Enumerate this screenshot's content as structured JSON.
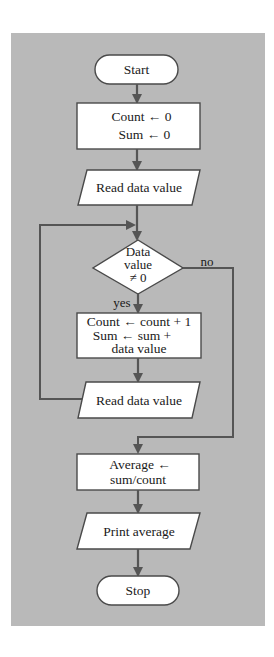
{
  "diagram": {
    "type": "flowchart",
    "colors": {
      "background": "#ffffff",
      "panel": "#b9b9b9",
      "shape_fill": "#ffffff",
      "stroke": "#4a4a4a",
      "arrow": "#555555",
      "text": "#1a1a1a"
    },
    "nodes": [
      {
        "id": "start",
        "shape": "terminal",
        "lines": [
          "Start"
        ]
      },
      {
        "id": "init",
        "shape": "process",
        "lines": [
          "Count ← 0",
          "Sum ← 0"
        ]
      },
      {
        "id": "read1",
        "shape": "input-output",
        "lines": [
          "Read data value"
        ]
      },
      {
        "id": "decision",
        "shape": "decision",
        "lines": [
          "Data",
          "value",
          "≠ 0"
        ]
      },
      {
        "id": "accumulate",
        "shape": "process",
        "lines": [
          "Count ← count + 1",
          "Sum ← sum +",
          "data value"
        ]
      },
      {
        "id": "read2",
        "shape": "input-output",
        "lines": [
          "Read data value"
        ]
      },
      {
        "id": "average",
        "shape": "process",
        "lines": [
          "Average ←",
          "sum/count"
        ]
      },
      {
        "id": "print",
        "shape": "input-output",
        "lines": [
          "Print average"
        ]
      },
      {
        "id": "stop",
        "shape": "terminal",
        "lines": [
          "Stop"
        ]
      }
    ],
    "edges": [
      {
        "from": "start",
        "to": "init",
        "label": ""
      },
      {
        "from": "init",
        "to": "read1",
        "label": ""
      },
      {
        "from": "read1",
        "to": "decision",
        "label": ""
      },
      {
        "from": "decision",
        "to": "accumulate",
        "label": "yes"
      },
      {
        "from": "decision",
        "to": "average",
        "label": "no"
      },
      {
        "from": "accumulate",
        "to": "read2",
        "label": ""
      },
      {
        "from": "read2",
        "to": "decision",
        "label": ""
      },
      {
        "from": "average",
        "to": "print",
        "label": ""
      },
      {
        "from": "print",
        "to": "stop",
        "label": ""
      }
    ],
    "edge_labels": {
      "yes": "yes",
      "no": "no"
    }
  }
}
